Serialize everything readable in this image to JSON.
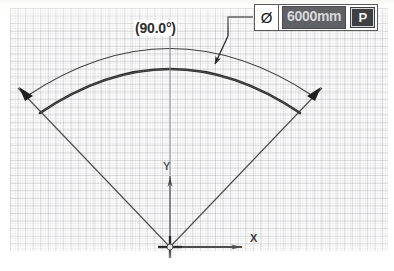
{
  "app": {
    "type": "cad-sketch-dimension-editor",
    "domain": "Computer-Use"
  },
  "dimension_input": {
    "symbol": "Ø",
    "symbol_name": "diameter-symbol",
    "value": "6000mm",
    "value_selected": true,
    "parameter_button_label": "P",
    "colors": {
      "field_background": "#5f6165",
      "field_text": "#d8d9dc",
      "button_background": "#3e3f43",
      "button_text": "#f2f2f2",
      "box_border": "#5a5a5a"
    }
  },
  "annotations": {
    "angle_label": "(90.0°)",
    "angle_value": 90.0,
    "angle_units": "degrees",
    "angle_is_driven": true
  },
  "axes": {
    "x_label": "X",
    "y_label": "Y",
    "origin_marker": "cross"
  },
  "geometry": {
    "arc_description": "thick-construction-arc",
    "dimension_arc_description": "angular-dimension-arc-with-arrowheads",
    "leader_description": "leader-line-from-dimension-box-to-arc",
    "grid_color": "#96989e",
    "line_color": "#3c3c3c"
  },
  "caption": {
    "text": " "
  }
}
